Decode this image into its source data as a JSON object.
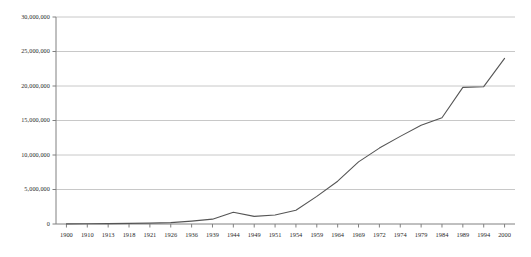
{
  "chart_data": {
    "type": "line",
    "title": "",
    "subtitle": "",
    "xlabel": "",
    "ylabel": "",
    "categories": [
      "1900",
      "1910",
      "1913",
      "1918",
      "1921",
      "1926",
      "1936",
      "1939",
      "1944",
      "1949",
      "1951",
      "1954",
      "1959",
      "1964",
      "1969",
      "1972",
      "1974",
      "1979",
      "1984",
      "1989",
      "1994",
      "2000"
    ],
    "values": [
      20000,
      40000,
      60000,
      90000,
      130000,
      200000,
      420000,
      700000,
      1700000,
      1100000,
      1300000,
      2000000,
      4000000,
      6200000,
      9000000,
      11000000,
      12700000,
      14300000,
      15400000,
      19800000,
      19900000,
      24000000
    ],
    "series": [
      {
        "name": "series-1",
        "values": [
          20000,
          40000,
          60000,
          90000,
          130000,
          200000,
          420000,
          700000,
          1700000,
          1100000,
          1300000,
          2000000,
          4000000,
          6200000,
          9000000,
          11000000,
          12700000,
          14300000,
          15400000,
          19800000,
          19900000,
          24000000
        ]
      }
    ],
    "ylim": [
      0,
      30000000
    ],
    "ytick_values": [
      0,
      5000000,
      10000000,
      15000000,
      20000000,
      25000000,
      30000000
    ],
    "ytick_labels": [
      "0",
      "5,000,000",
      "10,000,000",
      "15,000,000",
      "20,000,000",
      "25,000,000",
      "30,000,000"
    ],
    "grid": true,
    "grid_axis": "y",
    "legend": false,
    "legend_position": "none",
    "colors": {
      "line": "#555555",
      "grid": "#c8c8c8",
      "axis": "#808080",
      "background": "#ffffff",
      "text": "#2b2b2b"
    }
  }
}
